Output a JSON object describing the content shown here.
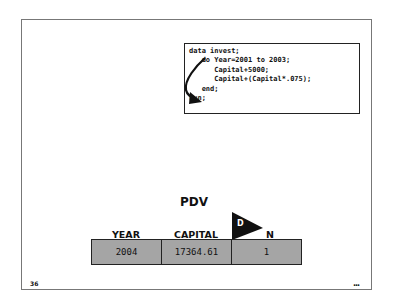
{
  "code": {
    "lines": [
      "data invest;",
      "   do Year=2001 to 2003;",
      "      Capital+5000;",
      "      Capital+(Capital*.075);",
      "   end;",
      "run;"
    ]
  },
  "pdv": {
    "title": "PDV",
    "columns": [
      "YEAR",
      "CAPITAL",
      "_N_"
    ],
    "values": [
      "2004",
      "17364.61",
      "1"
    ],
    "flag_label": "D",
    "cell_color": "#a5a5a5"
  },
  "footer": {
    "page_number": "36",
    "more_indicator": "..."
  }
}
